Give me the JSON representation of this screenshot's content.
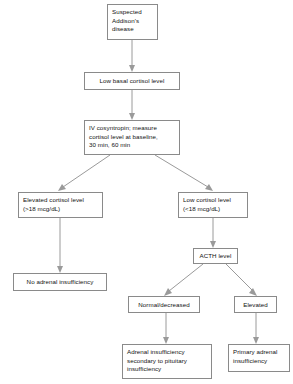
{
  "diagram": {
    "background_color": "#ffffff",
    "border_color": "#8a8a8a",
    "connector_color": "#9a9a9a",
    "text_color": "#111111"
  },
  "nodes": {
    "suspected_addisons": "Suspected\nAddison's\ndisease",
    "low_basal_cortisol": "Low basal cortisol level",
    "cosyntropin_test": "IV cosyntropin; measure\ncortisol level at baseline,\n30 min, 60 min",
    "elevated_cortisol": "Elevated cortisol level\n(>18 mcg/dL)",
    "low_cortisol": "Low cortisol level\n(<18 mcg/dL)",
    "no_adrenal_insufficiency": "No adrenal insufficiency",
    "acth_level": "ACTH level",
    "acth_normal_decreased": "Normal/decreased",
    "acth_elevated": "Elevated",
    "secondary_adrenal_insufficiency": "Adrenal insufficiency\nsecondary to pituitary\ninsufficiency",
    "primary_adrenal_insufficiency": "Primary adrenal\ninsufficiency"
  },
  "edges": [
    {
      "from": "suspected_addisons",
      "to": "low_basal_cortisol"
    },
    {
      "from": "low_basal_cortisol",
      "to": "cosyntropin_test"
    },
    {
      "from": "cosyntropin_test",
      "to": "elevated_cortisol"
    },
    {
      "from": "cosyntropin_test",
      "to": "low_cortisol"
    },
    {
      "from": "elevated_cortisol",
      "to": "no_adrenal_insufficiency"
    },
    {
      "from": "low_cortisol",
      "to": "acth_level"
    },
    {
      "from": "acth_level",
      "to": "acth_normal_decreased"
    },
    {
      "from": "acth_level",
      "to": "acth_elevated"
    },
    {
      "from": "acth_normal_decreased",
      "to": "secondary_adrenal_insufficiency"
    },
    {
      "from": "acth_elevated",
      "to": "primary_adrenal_insufficiency"
    }
  ]
}
